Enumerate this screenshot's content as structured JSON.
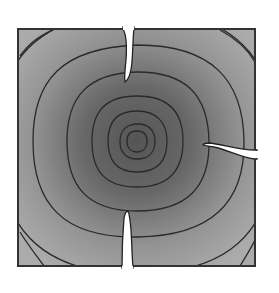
{
  "diagram": {
    "colors": {
      "background": "#ffffff",
      "plate_outer": "#a9a9a9",
      "plate_center": "#555555",
      "contour": "#2a2a2a",
      "border": "#333333",
      "crack": "#ffffff"
    },
    "plate": {
      "x": 18,
      "y": 29,
      "width": 237,
      "height": 237
    },
    "center": {
      "x": 137,
      "y": 141
    },
    "contour_radii": [
      10,
      17,
      30,
      46,
      70,
      104,
      140,
      175
    ],
    "cracks": [
      {
        "name": "top-crack",
        "edge": "top",
        "from": [
          128,
          29
        ],
        "to": [
          127,
          82
        ]
      },
      {
        "name": "right-crack",
        "edge": "right",
        "from": [
          255,
          155
        ],
        "to": [
          203,
          144
        ]
      },
      {
        "name": "bottom-crack",
        "edge": "bottom",
        "from": [
          128,
          266
        ],
        "to": [
          127,
          210
        ]
      }
    ]
  }
}
